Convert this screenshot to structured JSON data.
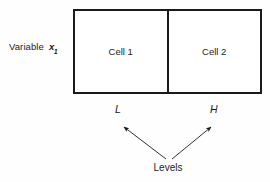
{
  "figure": {
    "variable": {
      "text": "Variable",
      "symbol": "x",
      "subscript": "1"
    },
    "cells": [
      {
        "label": "Cell 1"
      },
      {
        "label": "Cell 2"
      }
    ],
    "levels": [
      {
        "label": "L"
      },
      {
        "label": "H"
      }
    ],
    "levels_caption": "Levels",
    "colors": {
      "line": "#1a1a1a",
      "text": "#1d1d1d",
      "background": "#fefefe"
    }
  }
}
